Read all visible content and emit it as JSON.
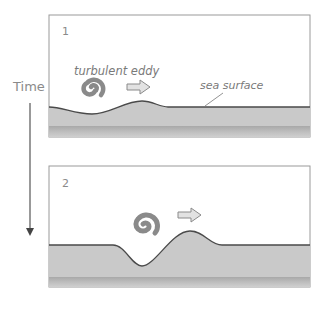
{
  "diagram": {
    "axis": {
      "label": "Time",
      "direction": "down"
    },
    "panels": [
      {
        "number": "1",
        "eddy_label": "turbulent eddy",
        "surface_label": "sea surface",
        "eddy_icon": "spiral-icon",
        "motion_icon": "right-arrow-icon"
      },
      {
        "number": "2",
        "eddy_icon": "spiral-icon",
        "motion_icon": "right-arrow-icon"
      }
    ],
    "colors": {
      "frame": "#9a9a9a",
      "surface_line": "#4a4a4a",
      "water": "#c8c8c8",
      "water_deep": "#b4b4b4",
      "eddy": "#8a8a8a",
      "arrow_fill": "#e0e0e0",
      "arrow_stroke": "#8a8a8a",
      "text": "#8a8a8a"
    }
  }
}
